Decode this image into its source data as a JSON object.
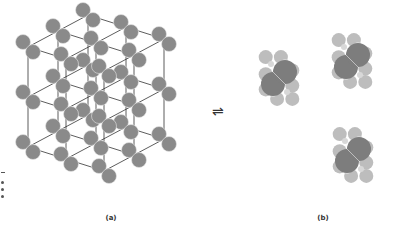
{
  "figure": {
    "panels": [
      {
        "id": "a",
        "caption": "(a)",
        "content": "crystal-lattice-of-diatomic-molecules"
      },
      {
        "id": "b",
        "caption": "(b)",
        "content": "three-free-molecules"
      }
    ],
    "equilibrium_symbol": "⇌",
    "colors": {
      "lattice_atom": "#8a8a8a",
      "lattice_bond": "#333333",
      "molecule_core": "#7d7d7d",
      "molecule_outer": "#bdbdbd",
      "molecule_link": "#d8d8d8",
      "background": "#ffffff"
    }
  }
}
